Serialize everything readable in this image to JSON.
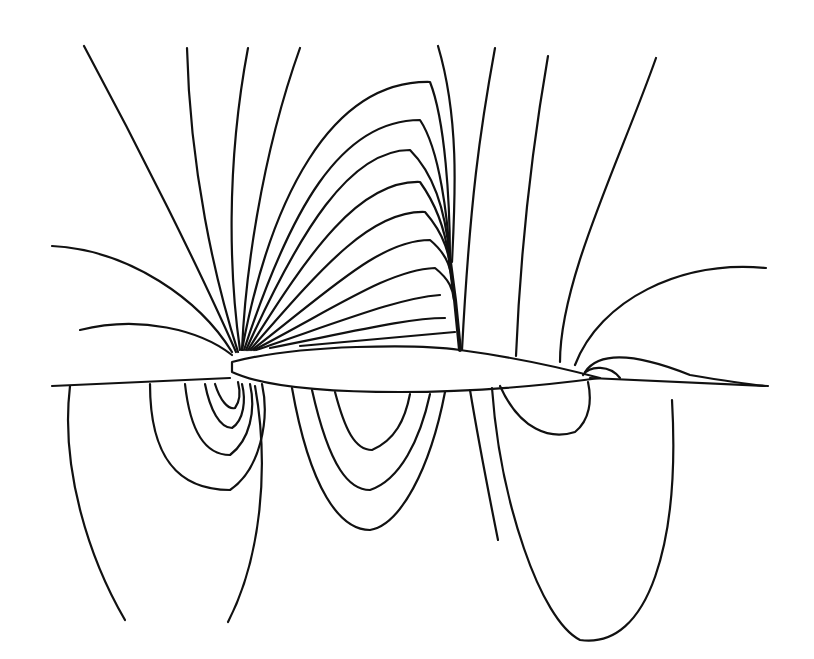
{
  "figure": {
    "background_color": "#ffffff",
    "line_color": "#111111",
    "elements": [
      "airfoil",
      "chord-line",
      "upper-contours",
      "shock",
      "lower-contours",
      "trailing-edge-contours"
    ]
  }
}
